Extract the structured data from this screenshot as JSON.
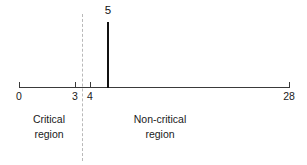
{
  "figure": {
    "background_color": "#ffffff",
    "width": 307,
    "height": 165
  },
  "chart_data": {
    "type": "line",
    "title": "",
    "subtitle": "",
    "xlabel": "",
    "ylabel": "",
    "xlim": [
      0,
      28
    ],
    "grid": false,
    "legend": null,
    "axis": {
      "orientation": "horizontal",
      "min": 0,
      "max": 28,
      "color": "#3a3a3a",
      "tick_labels": [
        "0",
        "3",
        "4",
        "28"
      ],
      "tick_values": [
        0,
        3,
        4,
        28
      ]
    },
    "markers": [
      {
        "name": "observed-statistic",
        "label": "5",
        "value": 5,
        "style": "solid-vertical-line",
        "color": "#111111"
      },
      {
        "name": "critical-value-divider",
        "label": "",
        "value": 3.5,
        "style": "dashed-vertical-line",
        "color": "#b9b9b9"
      }
    ],
    "annotations": [
      {
        "name": "critical-region",
        "line1": "Critical",
        "line2": "region",
        "center_value": 1.6
      },
      {
        "name": "non-critical-region",
        "line1": "Non-critical",
        "line2": "region",
        "center_value": 13.6
      }
    ]
  },
  "axis_ticks": [
    {
      "label": "0",
      "x": 19
    },
    {
      "label": "3",
      "x": 75
    },
    {
      "label": "4",
      "x": 90
    },
    {
      "label": "28",
      "x": 289
    }
  ],
  "spike": {
    "label": "5",
    "x": 108,
    "top": 22,
    "bottom": 88,
    "label_x": 108,
    "label_top": 4
  },
  "divider": {
    "x": 82
  },
  "regions": {
    "critical": {
      "line1": "Critical",
      "line2": "region",
      "x": 49,
      "top": 112
    },
    "noncritical": {
      "line1": "Non-critical",
      "line2": "region",
      "x": 160,
      "top": 112
    }
  }
}
